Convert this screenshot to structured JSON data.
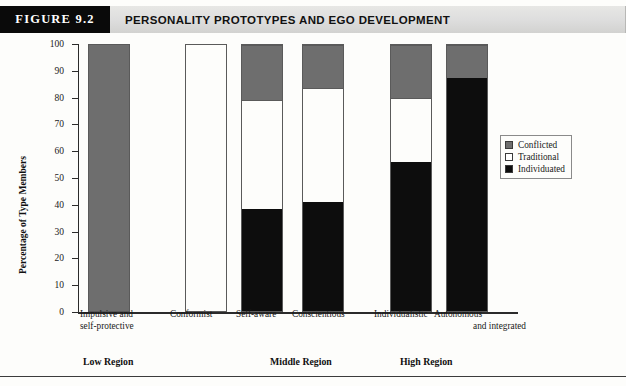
{
  "figure": {
    "tag": "FIGURE 9.2",
    "title": "PERSONALITY PROTOTYPES AND EGO DEVELOPMENT"
  },
  "legend": {
    "position": "right",
    "items": [
      {
        "label": "Conflicted",
        "swatch": "conflicted"
      },
      {
        "label": "Traditional",
        "swatch": "traditional"
      },
      {
        "label": "Individuated",
        "swatch": "individuated"
      }
    ]
  },
  "regions": [
    {
      "label": "Low Region"
    },
    {
      "label": "Middle Region"
    },
    {
      "label": "High Region"
    }
  ],
  "colors": {
    "conflicted": "#6e6e6e",
    "traditional": "#fdfdfb",
    "individuated": "#0d0d0d",
    "axis": "#2b2b2b",
    "header_tag_bg": "#0a0a0a",
    "header_bar_bg": "#dedede"
  },
  "chart_data": {
    "type": "bar",
    "title": "PERSONALITY PROTOTYPES AND EGO DEVELOPMENT",
    "subtitle": "",
    "stacked": true,
    "xlabel": "",
    "ylabel": "Percentage of Type Members",
    "ylim": [
      0,
      100
    ],
    "yticks": [
      0,
      10,
      20,
      30,
      40,
      50,
      60,
      70,
      80,
      90,
      100
    ],
    "ytick_labels": [
      "0",
      "10",
      "20",
      "30",
      "40",
      "50",
      "60",
      "70",
      "80",
      "90",
      "100"
    ],
    "grid": false,
    "legend_position": "right",
    "categories": [
      "Impulsive and self-protective",
      "Conformist",
      "Self-aware",
      "Conscientious",
      "Individualistic",
      "Autonomous and integrated"
    ],
    "category_labels": [
      [
        "Impulsive and",
        "self-protective"
      ],
      [
        "Conformist"
      ],
      [
        "Self-aware"
      ],
      [
        "Conscientious"
      ],
      [
        "Individualistic"
      ],
      [
        "Autonomous",
        "and integrated"
      ]
    ],
    "group_labels": [
      "Low Region",
      "Low Region",
      "Middle Region",
      "Middle Region",
      "High Region",
      "High Region"
    ],
    "series": [
      {
        "name": "Individuated",
        "color": "#0d0d0d",
        "values": [
          0,
          0,
          38.5,
          41,
          56,
          87.5
        ]
      },
      {
        "name": "Traditional",
        "color": "#fdfdfb",
        "values": [
          0,
          100,
          41,
          43,
          24,
          0
        ]
      },
      {
        "name": "Conflicted",
        "color": "#6e6e6e",
        "values": [
          100,
          0,
          20.5,
          16,
          20,
          12.5
        ]
      }
    ]
  }
}
